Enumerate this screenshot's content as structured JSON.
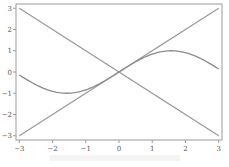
{
  "chart_data": {
    "type": "line",
    "title": "",
    "xlabel": "",
    "ylabel": "",
    "xlim": [
      -3.1,
      3.1
    ],
    "ylim": [
      -3.2,
      3.2
    ],
    "grid": false,
    "legend": null,
    "x_ticks": [
      -3,
      -2,
      -1,
      0,
      1,
      2,
      3
    ],
    "y_ticks": [
      -3,
      -2,
      -1,
      0,
      1,
      2,
      3
    ],
    "series": [
      {
        "name": "y = x",
        "function": "x",
        "x": [
          -3,
          3
        ],
        "values": [
          -3,
          3
        ],
        "color": "#999999"
      },
      {
        "name": "y = -x",
        "function": "-x",
        "x": [
          -3,
          3
        ],
        "values": [
          3,
          -3
        ],
        "color": "#999999"
      },
      {
        "name": "y = sin(x)",
        "function": "sin(x)",
        "x": [
          -3,
          -2.5,
          -2,
          -1.5708,
          -1,
          -0.5,
          0,
          0.5,
          1,
          1.5708,
          2,
          2.5,
          3
        ],
        "values": [
          -0.14,
          -0.6,
          -0.91,
          -1.0,
          -0.84,
          -0.48,
          0,
          0.48,
          0.84,
          1.0,
          0.91,
          0.6,
          0.14
        ],
        "color": "#8a8a8a"
      }
    ]
  }
}
